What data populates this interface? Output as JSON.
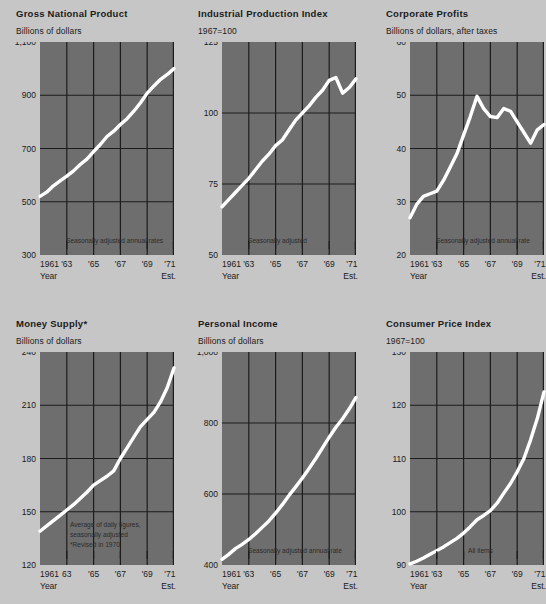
{
  "page": {
    "background_color": "#c6c6c6",
    "plot_background_color": "#6e6e6e",
    "gridline_color": "#1c1c1c",
    "line_color": "#ffffff",
    "text_color": "#1a1a1a"
  },
  "layout": {
    "columns": 3,
    "rows": 2,
    "panel_width": 176,
    "plot_width": 134,
    "plot_height": 213
  },
  "common": {
    "year_axis_label": "Year",
    "estimate_label": "Est.",
    "x_tick_labels": [
      "1961",
      "'63",
      "'65",
      "'67",
      "'69",
      "'71"
    ],
    "x_range": [
      1961,
      1971
    ]
  },
  "chart_data": [
    {
      "id": "gross-national-product",
      "type": "line",
      "title": "Gross National Product",
      "ylabel": "Billions of dollars",
      "xlabel": "Year",
      "estimate_label": "Est.",
      "ylim": [
        300,
        1100
      ],
      "y_ticks": [
        300,
        500,
        700,
        900,
        1100
      ],
      "y_tick_labels": [
        "300",
        "500",
        "700",
        "900",
        "1,100"
      ],
      "gridlines_y": [
        500,
        700,
        900
      ],
      "x_tick_labels": [
        "1961",
        "'63",
        "'65",
        "'67",
        "'69",
        "'71"
      ],
      "gridlines_x": [
        1963,
        1965,
        1967,
        1969,
        1971
      ],
      "annotation": "Seasonally adjusted annual rates",
      "grid": true,
      "legend": "none",
      "x": [
        1961,
        1961.5,
        1962,
        1962.5,
        1963,
        1963.5,
        1964,
        1964.5,
        1965,
        1965.5,
        1966,
        1966.5,
        1967,
        1967.5,
        1968,
        1968.5,
        1969,
        1969.5,
        1970,
        1970.5,
        1971
      ],
      "values": [
        520,
        536,
        560,
        578,
        596,
        616,
        640,
        660,
        688,
        715,
        745,
        765,
        790,
        812,
        840,
        872,
        908,
        935,
        960,
        978,
        1000
      ]
    },
    {
      "id": "industrial-production-index",
      "type": "line",
      "title": "Industrial Production Index",
      "ylabel": "1967=100",
      "xlabel": "Year",
      "estimate_label": "Est.",
      "ylim": [
        50,
        125
      ],
      "y_ticks": [
        50,
        75,
        100,
        125
      ],
      "y_tick_labels": [
        "50",
        "75",
        "100",
        "125"
      ],
      "gridlines_y": [
        75,
        100
      ],
      "x_tick_labels": [
        "1961",
        "'63",
        "'65",
        "'67",
        "'69",
        "'71"
      ],
      "gridlines_x": [
        1963,
        1965,
        1967,
        1969,
        1971
      ],
      "annotation": "Seasonally adjusted",
      "grid": true,
      "legend": "none",
      "x": [
        1961,
        1961.5,
        1962,
        1962.5,
        1963,
        1963.5,
        1964,
        1964.5,
        1965,
        1965.5,
        1966,
        1966.5,
        1967,
        1967.5,
        1968,
        1968.5,
        1969,
        1969.5,
        1970,
        1970.5,
        1971
      ],
      "values": [
        67,
        69.5,
        72,
        74.5,
        77,
        80,
        83,
        85.5,
        88.5,
        90.5,
        94,
        97.5,
        100,
        102.5,
        105.5,
        108,
        111.5,
        112.5,
        107,
        109,
        112
      ]
    },
    {
      "id": "corporate-profits",
      "type": "line",
      "title": "Corporate Profits",
      "ylabel": "Billions of dollars, after taxes",
      "xlabel": "Year",
      "estimate_label": "Est.",
      "ylim": [
        20,
        60
      ],
      "y_ticks": [
        20,
        30,
        40,
        50,
        60
      ],
      "y_tick_labels": [
        "20",
        "30",
        "40",
        "50",
        "60"
      ],
      "gridlines_y": [
        30,
        40,
        50
      ],
      "x_tick_labels": [
        "1961",
        "'63",
        "'65",
        "'67",
        "'69",
        "'71"
      ],
      "gridlines_x": [
        1963,
        1965,
        1967,
        1969,
        1971
      ],
      "annotation": "Seasonally adjusted annual rate",
      "grid": true,
      "legend": "none",
      "x": [
        1961,
        1961.5,
        1962,
        1962.5,
        1963,
        1963.5,
        1964,
        1964.5,
        1965,
        1965.5,
        1966,
        1966.5,
        1967,
        1967.5,
        1968,
        1968.5,
        1969,
        1969.5,
        1970,
        1970.5,
        1971
      ],
      "values": [
        27,
        29.5,
        31,
        31.5,
        32,
        34,
        36.5,
        39,
        42.5,
        46,
        49.8,
        47.5,
        46,
        45.8,
        47.5,
        47,
        45,
        43,
        41,
        43.5,
        44.5
      ]
    },
    {
      "id": "money-supply",
      "type": "line",
      "title": "Money Supply*",
      "ylabel": "Billions of dollars",
      "xlabel": "Year",
      "estimate_label": "Est.",
      "ylim": [
        120,
        240
      ],
      "y_ticks": [
        120,
        150,
        180,
        210,
        240
      ],
      "y_tick_labels": [
        "120",
        "150",
        "180",
        "210",
        "240"
      ],
      "gridlines_y": [
        150,
        180,
        210
      ],
      "x_tick_labels": [
        "1961",
        "63",
        "'65",
        "'67",
        "'69",
        "'71"
      ],
      "gridlines_x": [
        1963,
        1965,
        1967,
        1969,
        1971
      ],
      "annotation": "Average of daily figures,\nseasonally adjusted\n*Revised in 1970",
      "annotation_lines": [
        "Average of daily figures,",
        "seasonally adjusted",
        "*Revised in 1970"
      ],
      "grid": true,
      "legend": "none",
      "x": [
        1961,
        1961.5,
        1962,
        1962.5,
        1963,
        1963.5,
        1964,
        1964.5,
        1965,
        1965.5,
        1966,
        1966.5,
        1967,
        1967.5,
        1968,
        1968.5,
        1969,
        1969.5,
        1970,
        1970.5,
        1971
      ],
      "values": [
        139,
        142,
        145,
        148,
        151,
        154,
        157.5,
        161,
        165,
        167.5,
        170,
        173,
        180,
        186,
        192,
        198,
        202,
        206,
        212,
        220,
        231
      ]
    },
    {
      "id": "personal-income",
      "type": "line",
      "title": "Personal Income",
      "ylabel": "Billions of dollars",
      "xlabel": "Year",
      "estimate_label": "Est.",
      "ylim": [
        400,
        1000
      ],
      "y_ticks": [
        400,
        600,
        800,
        1000
      ],
      "y_tick_labels": [
        "400",
        "600",
        "800",
        "1,000"
      ],
      "gridlines_y": [
        600,
        800
      ],
      "x_tick_labels": [
        "1961",
        "'63",
        "'65",
        "'67",
        "'69",
        "'71"
      ],
      "gridlines_x": [
        1963,
        1965,
        1967,
        1969,
        1971
      ],
      "annotation": "Seasonally adjusted annual rate",
      "grid": true,
      "legend": "none",
      "x": [
        1961,
        1961.5,
        1962,
        1962.5,
        1963,
        1963.5,
        1964,
        1964.5,
        1965,
        1965.5,
        1966,
        1966.5,
        1967,
        1967.5,
        1968,
        1968.5,
        1969,
        1969.5,
        1970,
        1970.5,
        1971
      ],
      "values": [
        416,
        430,
        446,
        458,
        472,
        488,
        506,
        524,
        546,
        570,
        596,
        620,
        645,
        672,
        700,
        730,
        760,
        788,
        812,
        840,
        872
      ]
    },
    {
      "id": "consumer-price-index",
      "type": "line",
      "title": "Consumer Price Index",
      "ylabel": "1967=100",
      "xlabel": "Year",
      "estimate_label": "Est.",
      "ylim": [
        90,
        130
      ],
      "y_ticks": [
        90,
        100,
        110,
        120,
        130
      ],
      "y_tick_labels": [
        "90",
        "100",
        "110",
        "120",
        "130"
      ],
      "gridlines_y": [
        100,
        110,
        120
      ],
      "x_tick_labels": [
        "1961",
        "'63",
        "'65",
        "'67",
        "'69",
        "'71"
      ],
      "gridlines_x": [
        1963,
        1965,
        1967,
        1969,
        1971
      ],
      "annotation": "All items",
      "grid": true,
      "legend": "none",
      "x": [
        1961,
        1961.5,
        1962,
        1962.5,
        1963,
        1963.5,
        1964,
        1964.5,
        1965,
        1965.5,
        1966,
        1966.5,
        1967,
        1967.5,
        1968,
        1968.5,
        1969,
        1969.5,
        1970,
        1970.5,
        1971
      ],
      "values": [
        90.2,
        90.7,
        91.3,
        92.0,
        92.7,
        93.4,
        94.2,
        95.0,
        96.0,
        97.2,
        98.5,
        99.3,
        100.2,
        101.6,
        103.5,
        105.3,
        107.5,
        110.0,
        113.5,
        117.5,
        122.5
      ]
    }
  ]
}
